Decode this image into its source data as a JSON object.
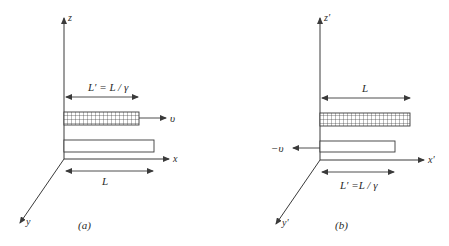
{
  "panels": [
    {
      "id": "a",
      "caption": "(a)",
      "axes": {
        "z": "z",
        "x": "x",
        "y": "y"
      },
      "top_dimension_label": "L′ = L / γ",
      "bottom_dimension_label": "L",
      "velocity_label": "υ",
      "moving_rod": {
        "pattern": "grid",
        "length_label": "L′ = L / γ",
        "direction": "+x"
      },
      "stationary_rod": {
        "pattern": "plain",
        "length_label": "L"
      }
    },
    {
      "id": "b",
      "caption": "(b)",
      "axes": {
        "z": "z′",
        "x": "x′",
        "y": "y′"
      },
      "top_dimension_label": "L",
      "bottom_dimension_label": "L′ =L / γ",
      "velocity_label": "−υ",
      "moving_rod": {
        "pattern": "plain",
        "length_label": "L′ =L / γ",
        "direction": "-x"
      },
      "stationary_rod": {
        "pattern": "grid",
        "length_label": "L"
      }
    }
  ],
  "colors": {
    "line": "#3a3a3a",
    "background": "#ffffff"
  }
}
